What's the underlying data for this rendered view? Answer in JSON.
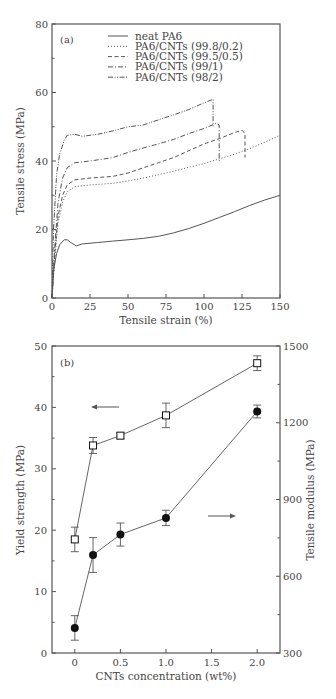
{
  "chart_data": [
    {
      "type": "line",
      "panel": "(a)",
      "xlabel": "Tensile strain (%)",
      "ylabel": "Tensile stress (MPa)",
      "xlim": [
        0,
        150
      ],
      "ylim": [
        0,
        80
      ],
      "xticks": [
        0,
        25,
        50,
        75,
        100,
        125,
        150
      ],
      "yticks": [
        0,
        20,
        40,
        60,
        80
      ],
      "grid": false,
      "legend_position": "upper center",
      "series": [
        {
          "name": "neat PA6",
          "style": "solid",
          "x": [
            0,
            1,
            3,
            5,
            8,
            10,
            13,
            16,
            20,
            30,
            40,
            50,
            60,
            70,
            80,
            90,
            100,
            110,
            120,
            130,
            140,
            150
          ],
          "y": [
            0,
            8,
            13,
            15.5,
            17,
            17,
            16,
            15.2,
            15.8,
            16.2,
            16.6,
            17,
            17.4,
            18,
            19,
            20.3,
            21.8,
            23.5,
            25.2,
            27,
            28.6,
            30
          ]
        },
        {
          "name": "PA6/CNTs (99.8/0.2)",
          "style": "dotted",
          "x": [
            0,
            2,
            4,
            7,
            10,
            15,
            25,
            40,
            50,
            60,
            70,
            80,
            90,
            100,
            110,
            120,
            130,
            140,
            150
          ],
          "y": [
            0,
            12,
            22,
            28,
            31,
            32.5,
            33,
            33.5,
            34.2,
            35,
            36,
            37,
            38.2,
            39.2,
            40.6,
            42,
            43.6,
            45.5,
            47.5
          ]
        },
        {
          "name": "PA6/CNTs (99.5/0.5)",
          "style": "dashed",
          "x": [
            0,
            2,
            4,
            7,
            10,
            15,
            25,
            40,
            50,
            60,
            70,
            80,
            90,
            100,
            110,
            120,
            125,
            127,
            127
          ],
          "y": [
            0,
            14,
            24,
            30,
            33,
            34.5,
            35,
            35.5,
            36.5,
            38,
            39.5,
            41,
            43,
            45,
            46.5,
            48.3,
            49,
            48,
            41
          ]
        },
        {
          "name": "PA6/CNTs (99/1)",
          "style": "dash-dot",
          "x": [
            0,
            2,
            4,
            7,
            10,
            15,
            25,
            40,
            50,
            60,
            70,
            80,
            90,
            100,
            108,
            110,
            110
          ],
          "y": [
            0,
            16,
            28,
            35,
            38,
            39.5,
            40,
            41,
            42.5,
            43.8,
            45,
            46.3,
            48,
            49.5,
            51,
            50.5,
            40
          ]
        },
        {
          "name": "PA6/CNTs (98/2)",
          "style": "dash-dot-dot",
          "x": [
            0,
            1,
            3,
            5,
            8,
            10,
            15,
            20,
            30,
            40,
            50,
            60,
            70,
            80,
            90,
            100,
            106,
            106
          ],
          "y": [
            0,
            20,
            36,
            42,
            46,
            47.5,
            47.8,
            47.2,
            47.8,
            48.8,
            50,
            50.5,
            52,
            53.5,
            55,
            57,
            58,
            50
          ]
        }
      ]
    },
    {
      "type": "line",
      "panel": "(b)",
      "xlabel": "CNTs concentration (wt%)",
      "ylabel": "Yield strength (MPa)",
      "ylabel_right": "Tensile modulus (MPa)",
      "xlim": [
        -0.25,
        2.25
      ],
      "ylim": [
        0,
        50
      ],
      "ylim_right": [
        300,
        1500
      ],
      "xticks": [
        0,
        0.5,
        1.0,
        1.5,
        2.0
      ],
      "xtick_labels": [
        "0",
        "0.5",
        "1.0",
        "1.5",
        "2.0"
      ],
      "yticks": [
        0,
        10,
        20,
        30,
        40,
        50
      ],
      "yticks_right": [
        300,
        600,
        900,
        1200,
        1500
      ],
      "grid": false,
      "categories": [
        0,
        0.2,
        0.5,
        1.0,
        2.0
      ],
      "series": [
        {
          "name": "Yield strength",
          "axis": "left",
          "marker": "open-square",
          "values": [
            18.5,
            33.8,
            35.4,
            38.7,
            47.2
          ],
          "errors": [
            2.0,
            1.3,
            0.5,
            2.0,
            1.2
          ]
        },
        {
          "name": "Tensile modulus",
          "axis": "right",
          "marker": "filled-circle",
          "values": [
            398,
            683,
            763,
            828,
            1244
          ],
          "errors": [
            48,
            68,
            45,
            30,
            25
          ]
        }
      ],
      "annotations": [
        {
          "type": "arrow",
          "direction": "left",
          "meaning": "Yield strength on left axis"
        },
        {
          "type": "arrow",
          "direction": "right",
          "meaning": "Tensile modulus on right axis"
        }
      ]
    }
  ],
  "labels": {
    "panel_a": "(a)",
    "panel_b": "(b)",
    "a_xlabel": "Tensile strain (%)",
    "a_ylabel": "Tensile stress (MPa)",
    "b_xlabel": "CNTs concentration (wt%)",
    "b_ylabel_left": "Yield strength (MPa)",
    "b_ylabel_right": "Tensile modulus (MPa)"
  },
  "legend": [
    "neat PA6",
    "PA6/CNTs (99.8/0.2)",
    "PA6/CNTs (99.5/0.5)",
    "PA6/CNTs (99/1)",
    "PA6/CNTs (98/2)"
  ],
  "colors": {
    "line": "#555555",
    "frame": "#555555",
    "text": "#444444",
    "marker": "#111111"
  }
}
